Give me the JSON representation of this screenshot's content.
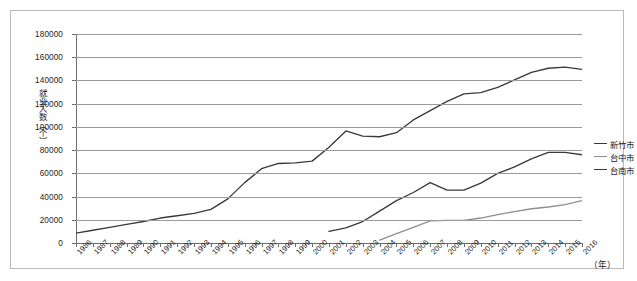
{
  "chart_data": {
    "type": "line",
    "title": "",
    "xlabel": "（年）",
    "ylabel": "就业人数（个）",
    "ylim": [
      0,
      180000
    ],
    "ytick_labels": [
      "180000",
      "160000",
      "140000",
      "120000",
      "100000",
      "80000",
      "60000",
      "40000",
      "20000",
      "0"
    ],
    "ytick_values": [
      180000,
      160000,
      140000,
      120000,
      100000,
      80000,
      60000,
      40000,
      20000,
      0
    ],
    "grid": true,
    "legend_position": "right",
    "categories": [
      "1986",
      "1987",
      "1988",
      "1989",
      "1990",
      "1991",
      "1992",
      "1993",
      "1994",
      "1995",
      "1996",
      "1997",
      "1998",
      "1999",
      "2000",
      "2001",
      "2002",
      "2003",
      "2004",
      "2005",
      "2006",
      "2007",
      "2008",
      "2009",
      "2010",
      "2011",
      "2012",
      "2013",
      "2014",
      "2015",
      "2016"
    ],
    "series": [
      {
        "name": "新竹市",
        "color": "#3a3a3a",
        "values": [
          8500,
          11000,
          13500,
          16000,
          18500,
          21500,
          23500,
          25500,
          29000,
          38000,
          52000,
          64000,
          68500,
          69000,
          70500,
          82500,
          96500,
          92000,
          91500,
          95000,
          106000,
          114000,
          122000,
          128500,
          129500,
          134000,
          140500,
          147000,
          150500,
          151500,
          149500
        ]
      },
      {
        "name": "台中市",
        "color": "#8f8f8f",
        "values": [
          null,
          null,
          null,
          null,
          null,
          null,
          null,
          null,
          null,
          null,
          null,
          null,
          null,
          null,
          null,
          null,
          null,
          null,
          2500,
          8000,
          13500,
          19000,
          19500,
          19500,
          21500,
          24500,
          27000,
          29500,
          31000,
          33000,
          36500
        ]
      },
      {
        "name": "台南市",
        "color": "#3a3a3a",
        "values": [
          null,
          null,
          null,
          null,
          null,
          null,
          null,
          null,
          null,
          null,
          null,
          null,
          null,
          null,
          null,
          10000,
          13000,
          18500,
          27500,
          36500,
          43500,
          52000,
          45500,
          45500,
          51500,
          60000,
          65500,
          72500,
          78000,
          78000,
          76000
        ]
      }
    ]
  },
  "legend": {
    "items": [
      {
        "label": "新竹市"
      },
      {
        "label": "台中市"
      },
      {
        "label": "台南市"
      }
    ]
  }
}
